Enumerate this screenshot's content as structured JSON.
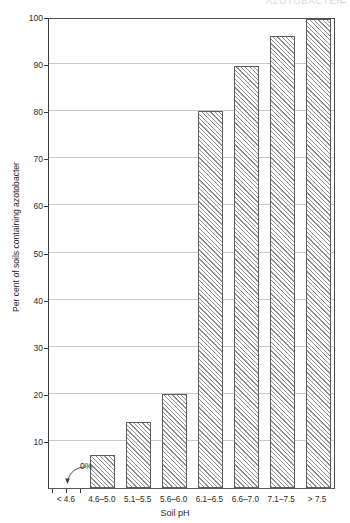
{
  "figure": {
    "running_head": "AZOTOBACTER",
    "xlabel": "Soil pH",
    "ylabel": "Per cent of soils containing azotobacter",
    "annotation": {
      "label": "0%",
      "points_to": "< 4.6"
    }
  },
  "chart_data": {
    "type": "bar",
    "title": "",
    "xlabel": "Soil pH",
    "ylabel": "Per cent of soils containing azotobacter",
    "categories": [
      "< 4.6",
      "4.6–5.0",
      "5.1–5.5",
      "5.6–6.0",
      "6.1–6.5",
      "6.6–7.0",
      "7.1–7.5",
      "> 7.5"
    ],
    "values": [
      0,
      7,
      14,
      20,
      80,
      89.5,
      96,
      99.5
    ],
    "ylim": [
      0,
      100
    ],
    "yticks": [
      10,
      20,
      30,
      40,
      50,
      60,
      70,
      80,
      90,
      100
    ],
    "ytick_labels": [
      "10",
      "20",
      "30",
      "40",
      "50",
      "60",
      "70",
      "80",
      "90",
      "100"
    ],
    "grid": "horizontal",
    "legend": "none",
    "bar_fill": "diagonal-hatch",
    "annotations": [
      {
        "text": "0%",
        "target_category": "< 4.6",
        "value": 0
      }
    ]
  },
  "colors": {
    "axis": "#3a3a3a",
    "grid": "#c9c9c9",
    "bar_edge": "#5d5d5d",
    "hatch": "#8d8d8d",
    "text": "#1f1f1f",
    "background": "#ffffff"
  }
}
